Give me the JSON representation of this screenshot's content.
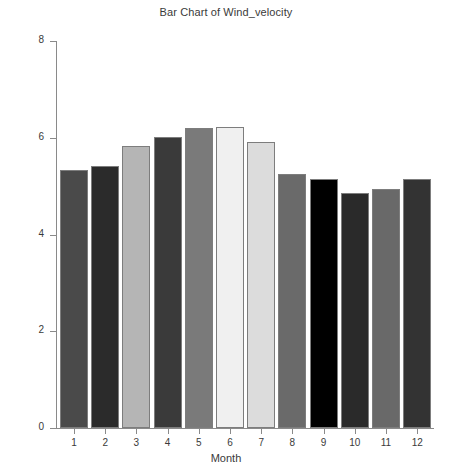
{
  "chart_data": {
    "type": "bar",
    "title": "Bar Chart of Wind_velocity",
    "xlabel": "Month",
    "ylabel": "Wind_velocity",
    "categories": [
      "1",
      "2",
      "3",
      "4",
      "5",
      "6",
      "7",
      "8",
      "9",
      "10",
      "11",
      "12"
    ],
    "values": [
      5.33,
      5.42,
      5.83,
      6.02,
      6.2,
      6.22,
      5.92,
      5.25,
      5.14,
      4.85,
      4.95,
      5.14
    ],
    "ylim": [
      0,
      8
    ],
    "yticks": [
      0,
      2,
      4,
      6,
      8
    ],
    "ytick_labels": [
      "0",
      "2",
      "4",
      "6",
      "8"
    ],
    "xtick_labels": [
      "1",
      "2",
      "3",
      "4",
      "5",
      "6",
      "7",
      "8",
      "9",
      "10",
      "11",
      "12"
    ],
    "grid": false,
    "legend": null,
    "bar_colors": [
      "#4a4a4a",
      "#2b2b2b",
      "#b5b5b5",
      "#3a3a3a",
      "#7a7a7a",
      "#f0f0f0",
      "#dcdcdc",
      "#6a6a6a",
      "#000000",
      "#2a2a2a",
      "#696969",
      "#333333"
    ],
    "bar_edge_color": "#7d7d7d",
    "axis_color": "#8a8a8a",
    "background": "#ffffff"
  }
}
